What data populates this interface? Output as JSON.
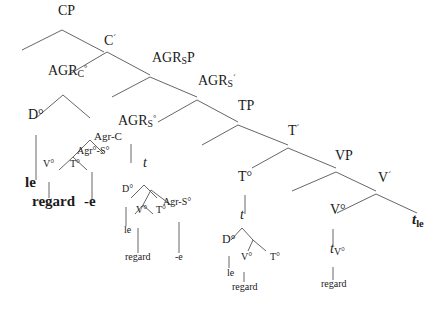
{
  "diagram": {
    "type": "syntax-tree",
    "line_color": "#666666",
    "text_color": "#1a1a1a",
    "nodes": [
      {
        "id": "cp",
        "text": "CP",
        "x": 58,
        "y": 16,
        "size": 14
      },
      {
        "id": "cbar",
        "text": "C",
        "sup": "´",
        "x": 104,
        "y": 46,
        "size": 14
      },
      {
        "id": "agrc",
        "text": "AGR",
        "sub": "C",
        "sup": "°",
        "x": 48,
        "y": 76,
        "size": 14
      },
      {
        "id": "agrsp",
        "text": "AGR",
        "sub": "S",
        "after": "P",
        "x": 152,
        "y": 63,
        "size": 14
      },
      {
        "id": "agrsbar",
        "text": "AGR",
        "sub": "S",
        "sup": "´",
        "x": 198,
        "y": 86,
        "size": 14
      },
      {
        "id": "do1",
        "text": "D°",
        "x": 28,
        "y": 120,
        "size": 14
      },
      {
        "id": "agrc2",
        "text": "Agr-C",
        "x": 94,
        "y": 140,
        "size": 11
      },
      {
        "id": "agrs2",
        "text": "Agr°-S°",
        "x": 77,
        "y": 154,
        "size": 10
      },
      {
        "id": "vo1",
        "text": "V°",
        "x": 43,
        "y": 167,
        "size": 10
      },
      {
        "id": "to1",
        "text": "T°",
        "x": 70,
        "y": 167,
        "size": 10
      },
      {
        "id": "le1",
        "text": "le",
        "x": 25,
        "y": 188,
        "size": 15,
        "bold": true
      },
      {
        "id": "regard1",
        "text": "regard",
        "x": 32,
        "y": 207,
        "size": 15,
        "bold": true
      },
      {
        "id": "e1",
        "text": "-e",
        "x": 84,
        "y": 207,
        "size": 15,
        "bold": true
      },
      {
        "id": "agrso",
        "text": "AGR",
        "sub": "S",
        "sup": "°",
        "x": 118,
        "y": 126,
        "size": 14
      },
      {
        "id": "tp",
        "text": "TP",
        "x": 238,
        "y": 111,
        "size": 14
      },
      {
        "id": "tbar",
        "text": "T",
        "sup": "´",
        "x": 288,
        "y": 136,
        "size": 14
      },
      {
        "id": "vp",
        "text": "VP",
        "x": 335,
        "y": 161,
        "size": 14
      },
      {
        "id": "vbar",
        "text": "V",
        "sup": "´",
        "x": 378,
        "y": 183,
        "size": 14
      },
      {
        "id": "t1",
        "text": "t",
        "x": 143,
        "y": 168,
        "size": 14,
        "italic": true
      },
      {
        "id": "do2",
        "text": "D°",
        "x": 122,
        "y": 192,
        "size": 10
      },
      {
        "id": "vo2",
        "text": "V°",
        "x": 136,
        "y": 213,
        "size": 10
      },
      {
        "id": "to2",
        "text": "T°",
        "x": 156,
        "y": 213,
        "size": 10
      },
      {
        "id": "agrs3",
        "text": "Agr-S°",
        "x": 163,
        "y": 205,
        "size": 10
      },
      {
        "id": "le2",
        "text": "le",
        "x": 124,
        "y": 233,
        "size": 10
      },
      {
        "id": "regard2",
        "text": "regard",
        "x": 125,
        "y": 260,
        "size": 10
      },
      {
        "id": "e2",
        "text": "-e",
        "x": 175,
        "y": 260,
        "size": 10
      },
      {
        "id": "to3",
        "text": "T°",
        "x": 238,
        "y": 182,
        "size": 14
      },
      {
        "id": "t2",
        "text": "t",
        "x": 240,
        "y": 220,
        "size": 14,
        "italic": true
      },
      {
        "id": "do3",
        "text": "D°",
        "x": 222,
        "y": 243,
        "size": 12
      },
      {
        "id": "vo3",
        "text": "V°",
        "x": 241,
        "y": 260,
        "size": 10
      },
      {
        "id": "to4",
        "text": "T°",
        "x": 270,
        "y": 260,
        "size": 10
      },
      {
        "id": "le3",
        "text": "le",
        "x": 227,
        "y": 276,
        "size": 10
      },
      {
        "id": "regard3",
        "text": "regard",
        "x": 232,
        "y": 290,
        "size": 10
      },
      {
        "id": "vo4",
        "text": "V°",
        "x": 330,
        "y": 215,
        "size": 14
      },
      {
        "id": "tv",
        "text": "t",
        "sub": "V°",
        "x": 330,
        "y": 254,
        "size": 14,
        "italic": true
      },
      {
        "id": "regard4",
        "text": "regard",
        "x": 321,
        "y": 287,
        "size": 10
      },
      {
        "id": "tle",
        "text": "t",
        "sub": "le",
        "x": 412,
        "y": 225,
        "size": 15,
        "italic": true,
        "bold": true
      }
    ],
    "edges": [
      [
        62,
        30,
        22,
        50
      ],
      [
        62,
        30,
        104,
        52
      ],
      [
        107,
        52,
        68,
        75
      ],
      [
        107,
        52,
        150,
        75
      ],
      [
        150,
        77,
        112,
        97
      ],
      [
        150,
        77,
        197,
        97
      ],
      [
        63,
        95,
        36,
        118
      ],
      [
        63,
        95,
        90,
        118
      ],
      [
        197,
        100,
        158,
        122
      ],
      [
        197,
        100,
        238,
        122
      ],
      [
        238,
        125,
        202,
        145
      ],
      [
        238,
        125,
        288,
        145
      ],
      [
        288,
        148,
        252,
        168
      ],
      [
        288,
        148,
        336,
        168
      ],
      [
        336,
        172,
        292,
        191
      ],
      [
        336,
        172,
        376,
        191
      ],
      [
        376,
        194,
        337,
        213
      ],
      [
        376,
        194,
        417,
        213
      ],
      [
        36,
        135,
        36,
        180
      ],
      [
        90,
        140,
        73,
        157
      ],
      [
        90,
        140,
        103,
        153
      ],
      [
        73,
        157,
        59,
        170
      ],
      [
        73,
        157,
        87,
        170
      ],
      [
        49,
        182,
        49,
        198
      ],
      [
        92,
        172,
        92,
        200
      ],
      [
        131,
        144,
        131,
        163
      ],
      [
        144,
        185,
        131,
        198
      ],
      [
        144,
        185,
        157,
        198
      ],
      [
        151,
        190,
        143,
        205
      ],
      [
        151,
        190,
        171,
        205
      ],
      [
        143,
        205,
        135,
        214
      ],
      [
        143,
        205,
        153,
        214
      ],
      [
        126,
        207,
        126,
        226
      ],
      [
        138,
        228,
        138,
        253
      ],
      [
        179,
        222,
        179,
        253
      ],
      [
        245,
        195,
        245,
        214
      ],
      [
        242,
        228,
        231,
        240
      ],
      [
        242,
        228,
        253,
        240
      ],
      [
        253,
        240,
        248,
        251
      ],
      [
        253,
        240,
        266,
        251
      ],
      [
        229,
        256,
        229,
        268
      ],
      [
        244,
        272,
        244,
        282
      ],
      [
        333,
        229,
        333,
        246
      ],
      [
        333,
        267,
        333,
        280
      ]
    ]
  }
}
